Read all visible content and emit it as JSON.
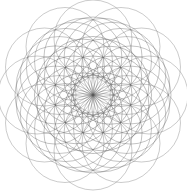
{
  "canvas": {
    "width": 187,
    "height": 195,
    "background_color": "#ffffff",
    "title": "Overlapping Circles Mandala"
  },
  "figure": {
    "name": "flower-of-life-mandala",
    "symmetry_fold": 12,
    "center_x": 93,
    "center_y": 95,
    "circle_radius": 39,
    "stroke_color": "#595959",
    "stroke_width": 0.55,
    "stroke_opacity": 0.72,
    "bounds": {
      "left": 15,
      "top": 15,
      "right": 171,
      "bottom": 180
    },
    "rings": [
      {
        "name": "ring-center",
        "center_distance": 0,
        "count": 1,
        "angle_offset_deg": 0,
        "opacity": 0.75
      },
      {
        "name": "ring-inner",
        "center_distance": 19.5,
        "count": 12,
        "angle_offset_deg": 0,
        "opacity": 0.72
      },
      {
        "name": "ring-middle",
        "center_distance": 39,
        "count": 12,
        "angle_offset_deg": 15,
        "opacity": 0.66
      },
      {
        "name": "ring-outer",
        "center_distance": 56,
        "count": 12,
        "angle_offset_deg": 0,
        "opacity": 0.58
      },
      {
        "name": "ring-rim",
        "center_distance": 39,
        "count": 12,
        "angle_offset_deg": 0,
        "opacity": 0.62
      }
    ]
  },
  "chart_data": {
    "type": "scatter",
    "xlabel": "",
    "ylabel": "",
    "xlim": [
      0,
      187
    ],
    "ylim": [
      0,
      195
    ],
    "grid": false,
    "legend": "none",
    "annotations": [],
    "series": [
      {
        "name": "circle-centers",
        "note": "Each point is the center of an equal-radius circle (r = 39 px)",
        "values": []
      }
    ]
  }
}
